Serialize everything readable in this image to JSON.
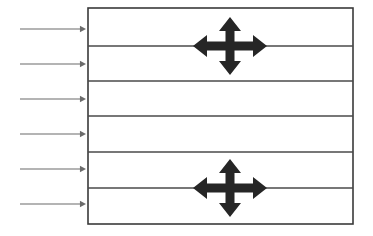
{
  "diagram": {
    "canvas": {
      "width": 373,
      "height": 236,
      "background": "#ffffff"
    },
    "colors": {
      "box_stroke": "#3a3a3a",
      "layer_line": "#4a4a4a",
      "incident_arrow": "#6b6b6b",
      "cross_arrow": "#262626",
      "background": "#ffffff"
    },
    "box": {
      "name": "layered-box",
      "x": 88,
      "y": 8,
      "width": 265,
      "height": 216,
      "stroke_width": 1.6
    },
    "layer_lines": [
      {
        "name": "layer-line-1",
        "y": 46,
        "x1": 88,
        "x2": 353,
        "stroke_width": 1.5
      },
      {
        "name": "layer-line-2",
        "y": 81,
        "x1": 88,
        "x2": 353,
        "stroke_width": 1.5
      },
      {
        "name": "layer-line-3",
        "y": 116,
        "x1": 88,
        "x2": 353,
        "stroke_width": 1.5
      },
      {
        "name": "layer-line-4",
        "y": 152,
        "x1": 88,
        "x2": 353,
        "stroke_width": 1.5
      },
      {
        "name": "layer-line-5",
        "y": 188,
        "x1": 88,
        "x2": 353,
        "stroke_width": 1.5
      }
    ],
    "incident_arrows": [
      {
        "name": "incident-arrow-1",
        "y": 29,
        "x1": 20,
        "x2": 86,
        "stroke_width": 1.1,
        "head_size": 3.2
      },
      {
        "name": "incident-arrow-2",
        "y": 64,
        "x1": 20,
        "x2": 86,
        "stroke_width": 1.1,
        "head_size": 3.2
      },
      {
        "name": "incident-arrow-3",
        "y": 99,
        "x1": 20,
        "x2": 86,
        "stroke_width": 1.1,
        "head_size": 3.2
      },
      {
        "name": "incident-arrow-4",
        "y": 134,
        "x1": 20,
        "x2": 86,
        "stroke_width": 1.1,
        "head_size": 3.2
      },
      {
        "name": "incident-arrow-5",
        "y": 169,
        "x1": 20,
        "x2": 86,
        "stroke_width": 1.1,
        "head_size": 3.2
      },
      {
        "name": "incident-arrow-6",
        "y": 204,
        "x1": 20,
        "x2": 86,
        "stroke_width": 1.1,
        "head_size": 3.2
      }
    ],
    "cross_arrows": [
      {
        "name": "cross-arrow-upper",
        "cx": 230,
        "cy": 46,
        "half_width": 37,
        "half_height": 29,
        "shaft": 9,
        "head_width": 22,
        "head_length": 14
      },
      {
        "name": "cross-arrow-lower",
        "cx": 230,
        "cy": 188,
        "half_width": 37,
        "half_height": 29,
        "shaft": 9,
        "head_width": 22,
        "head_length": 14
      }
    ]
  }
}
